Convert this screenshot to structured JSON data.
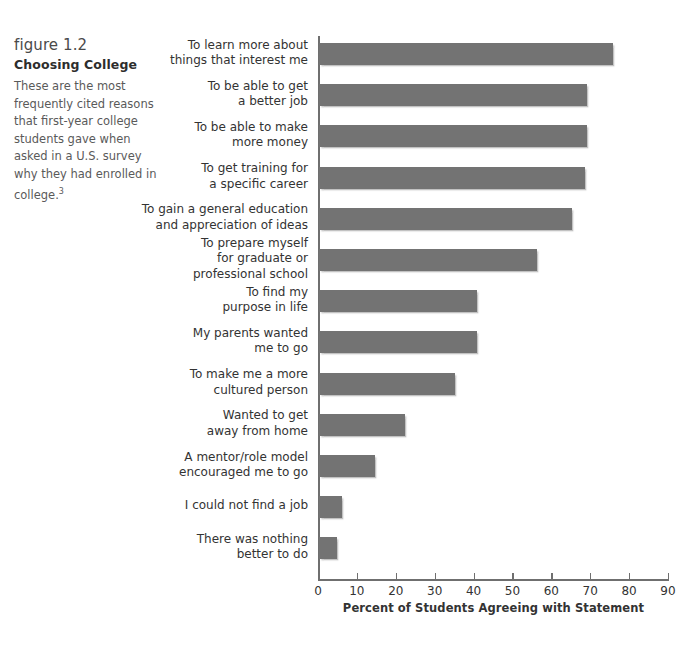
{
  "caption": {
    "figure_number": "figure 1.2",
    "title": "Choosing College",
    "body": "These are the most frequently cited reasons that first-year college students gave when asked in a U.S. survey why they had enrolled in college.",
    "footnote_marker": "3"
  },
  "colors": {
    "bar": "#737373",
    "axis": "#6f6f6f",
    "text": "#333333",
    "caption_text": "#5a5a5a",
    "background": "#ffffff"
  },
  "chart_data": {
    "type": "bar",
    "orientation": "horizontal",
    "title": "Choosing College",
    "xlabel": "Percent of Students Agreeing with Statement",
    "ylabel": "",
    "xlim": [
      0,
      90
    ],
    "xticks": [
      0,
      10,
      20,
      30,
      40,
      50,
      60,
      70,
      80,
      90
    ],
    "xtick_labels": [
      "0",
      "10",
      "20",
      "30",
      "40",
      "50",
      "60",
      "70",
      "80",
      "90"
    ],
    "grid": false,
    "legend": null,
    "categories": [
      "To learn more about things that interest me",
      "To be able to get a better job",
      "To be able to make more money",
      "To get training for a specific career",
      "To gain a general education and appreciation of ideas",
      "To prepare myself for graduate or professional school",
      "To find my purpose in life",
      "My parents wanted me to go",
      "To make me a more cultured person",
      "Wanted to get away from home",
      "A mentor/role model encouraged me to go",
      "I could not find a job",
      "There was nothing better to do"
    ],
    "category_lines": [
      [
        "To learn more about",
        "things that interest me"
      ],
      [
        "To be able to get",
        "a better job"
      ],
      [
        "To be able to make",
        "more money"
      ],
      [
        "To get training for",
        "a specific career"
      ],
      [
        "To gain a general education",
        "and appreciation of ideas"
      ],
      [
        "To prepare myself",
        "for graduate or",
        "professional school"
      ],
      [
        "To find my",
        "purpose in life"
      ],
      [
        "My parents wanted",
        "me to go"
      ],
      [
        "To make me a more",
        "cultured person"
      ],
      [
        "Wanted to get",
        "away from home"
      ],
      [
        "A mentor/role model",
        "encouraged me to go"
      ],
      [
        "I could not find a job"
      ],
      [
        "There was nothing",
        "better to do"
      ]
    ],
    "values": [
      75.5,
      69,
      69,
      68.5,
      65,
      56,
      40.5,
      40.5,
      35,
      22,
      14.5,
      6,
      4.5
    ]
  }
}
